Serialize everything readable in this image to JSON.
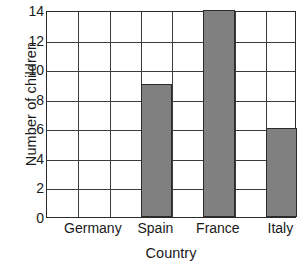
{
  "chart_data": {
    "type": "bar",
    "title": "",
    "xlabel": "Country",
    "ylabel": "Number of children",
    "categories": [
      "Germany",
      "Spain",
      "France",
      "Italy"
    ],
    "values": [
      0,
      9,
      14,
      6
    ],
    "series": [
      {
        "name": "Number of children",
        "values": [
          0,
          9,
          14,
          6
        ]
      }
    ],
    "ylim": [
      0,
      14
    ],
    "ytick_step": 2,
    "ytick_labels": [
      "0",
      "2",
      "4",
      "6",
      "8",
      "10",
      "12",
      "14"
    ],
    "ytick_values": [
      0,
      2,
      4,
      6,
      8,
      10,
      12,
      14
    ],
    "xtick_labels": [
      "Germany",
      "Spain",
      "France",
      "Italy"
    ],
    "grid": true,
    "grid_columns": 8,
    "grid_rows": 7,
    "legend": "none",
    "bar_color": "#808080",
    "bar_edge_color": "#2b2b2b",
    "grid_color": "#3c3c3c",
    "axis_color": "#2b2b2b",
    "background_color": "#ffffff",
    "bar_grid_columns": [
      2,
      4,
      6,
      8
    ],
    "label_grid_columns": [
      2,
      4,
      6,
      8
    ]
  }
}
